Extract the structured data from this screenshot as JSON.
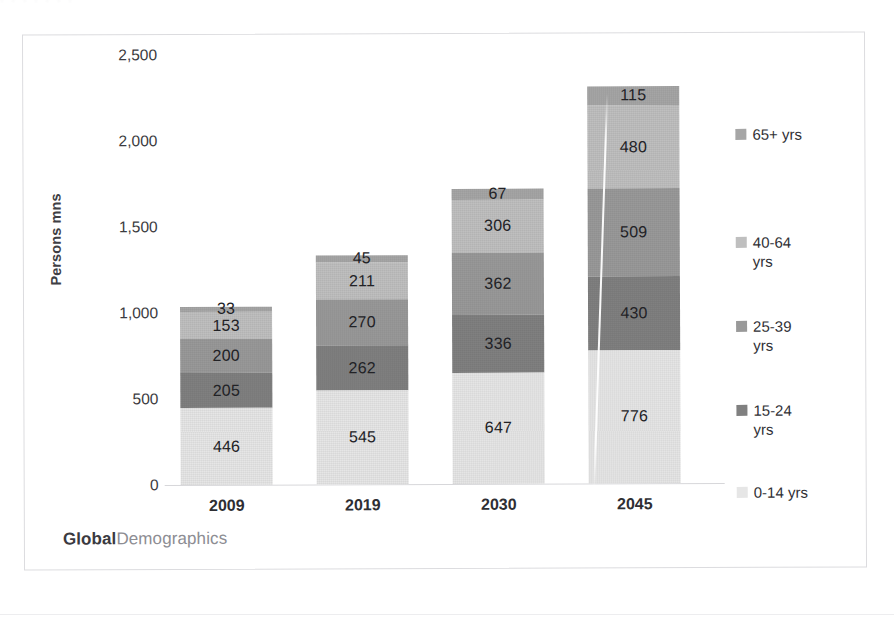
{
  "brand": {
    "part1": "Global",
    "part2": "Demographics"
  },
  "scan_artifact_text": "· · ·   · ·    · ·",
  "colors": {
    "series_65plus": "#a6a6a6",
    "series_40_64": "#bfbfbf",
    "series_25_39": "#999999",
    "series_15_24": "#808080",
    "series_0_14": "#e6e6e6",
    "axis": "#d7d7da",
    "text": "#303035",
    "frame": "#dcdcdf"
  },
  "chart_data": {
    "type": "bar",
    "stacked": true,
    "title": "",
    "xlabel": "",
    "ylabel": "Persons mns",
    "ylim": [
      0,
      2500
    ],
    "yticks": [
      "0",
      "500",
      "1,000",
      "1,500",
      "2,000",
      "2,500"
    ],
    "ytick_values": [
      0,
      500,
      1000,
      1500,
      2000,
      2500
    ],
    "grid": false,
    "legend_position": "right",
    "categories": [
      "2009",
      "2019",
      "2030",
      "2045"
    ],
    "series": [
      {
        "name": "0-14 yrs",
        "values": [
          446,
          545,
          647,
          776
        ]
      },
      {
        "name": "15-24 yrs",
        "values": [
          205,
          262,
          336,
          430
        ]
      },
      {
        "name": "25-39 yrs",
        "values": [
          200,
          270,
          362,
          509
        ]
      },
      {
        "name": "40-64 yrs",
        "values": [
          153,
          211,
          306,
          480
        ]
      },
      {
        "name": "65+ yrs",
        "values": [
          33,
          45,
          67,
          115
        ]
      }
    ],
    "totals": [
      1037,
      1333,
      1718,
      2310
    ],
    "legend": [
      "65+ yrs",
      "40-64 yrs",
      "25-39 yrs",
      "15-24 yrs",
      "0-14 yrs"
    ]
  }
}
